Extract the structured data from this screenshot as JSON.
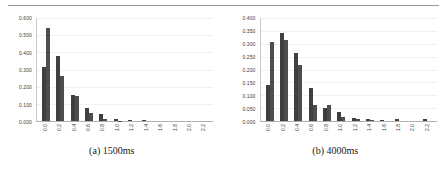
{
  "figure": {
    "has_top_rule": true,
    "background": "#ffffff",
    "bar_color_series1": "#3f3f3f",
    "bar_color_series2": "#4d4d4d",
    "gridline_color": "#f0f0f0"
  },
  "panels": [
    {
      "caption": "(a) 1500ms",
      "chart_data": {
        "type": "bar",
        "title": "",
        "xlabel": "",
        "ylabel": "",
        "ylim": [
          0,
          0.6
        ],
        "grid": true,
        "legend": "none",
        "yticks": [
          0.0,
          0.1,
          0.2,
          0.3,
          0.4,
          0.5,
          0.6
        ],
        "ytick_labels": [
          "0.000",
          "0.100",
          "0.200",
          "0.300",
          "0.400",
          "0.500",
          "0.600"
        ],
        "categories": [
          "0.0",
          "0.2",
          "0.4",
          "0.6",
          "0.8",
          "1.0",
          "1.2",
          "1.4",
          "1.6",
          "1.8",
          "2.0",
          "2.2"
        ],
        "series": [
          {
            "name": "series-1",
            "values": [
              0.315,
              0.38,
              0.152,
              0.078,
              0.04,
              0.014,
              0.004,
              0.006,
              0.0,
              0.0,
              0.0,
              0.0
            ]
          },
          {
            "name": "series-2",
            "values": [
              0.54,
              0.265,
              0.147,
              0.046,
              0.011,
              0.002,
              0.0,
              0.0,
              0.0,
              0.0,
              0.0,
              0.0
            ]
          }
        ]
      }
    },
    {
      "caption": "(b) 4000ms",
      "chart_data": {
        "type": "bar",
        "title": "",
        "xlabel": "",
        "ylabel": "",
        "ylim": [
          0,
          0.4
        ],
        "grid": true,
        "legend": "none",
        "yticks": [
          0.0,
          0.05,
          0.1,
          0.15,
          0.2,
          0.25,
          0.3,
          0.35,
          0.4
        ],
        "ytick_labels": [
          "0.000",
          "0.050",
          "0.100",
          "0.150",
          "0.200",
          "0.250",
          "0.300",
          "0.350",
          "0.400"
        ],
        "categories": [
          "0.0",
          "0.2",
          "0.4",
          "0.6",
          "0.8",
          "1.0",
          "1.2",
          "1.4",
          "1.6",
          "1.8",
          "2.0",
          "2.2"
        ],
        "series": [
          {
            "name": "series-1",
            "values": [
              0.14,
              0.342,
              0.263,
              0.128,
              0.049,
              0.034,
              0.012,
              0.008,
              0.004,
              0.006,
              0.0,
              0.006
            ]
          },
          {
            "name": "series-2",
            "values": [
              0.307,
              0.316,
              0.219,
              0.063,
              0.064,
              0.017,
              0.008,
              0.004,
              0.0,
              0.0,
              0.0,
              0.0
            ]
          }
        ]
      }
    }
  ]
}
